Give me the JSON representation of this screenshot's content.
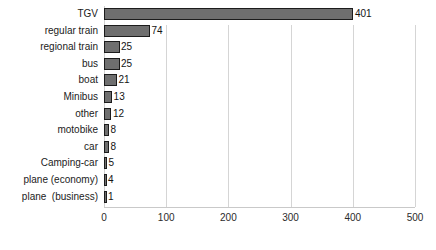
{
  "chart_data": {
    "type": "bar",
    "orientation": "horizontal",
    "title": "",
    "xlabel": "",
    "ylabel": "",
    "categories": [
      "TGV",
      "regular train",
      "regional train",
      "bus",
      "boat",
      "Minibus",
      "other",
      "motobike",
      "car",
      "Camping-car",
      "plane (economy)",
      "plane  (business)"
    ],
    "values": [
      401,
      74,
      25,
      25,
      21,
      13,
      12,
      8,
      8,
      5,
      4,
      1
    ],
    "value_labels": [
      "401",
      "74",
      "25",
      "25",
      "21",
      "13",
      "12",
      "8",
      "8",
      "5",
      "4",
      "1"
    ],
    "xlim": [
      0,
      500
    ],
    "xticks": [
      0,
      100,
      200,
      300,
      400,
      500
    ],
    "xtick_labels": [
      "0",
      "100",
      "200",
      "300",
      "400",
      "500"
    ],
    "grid": true,
    "grid_axis": "x",
    "legend": null,
    "colors": {
      "bar_fill": "#6f6f6f",
      "bar_edge": "#1c1c1c",
      "gridline": "#d5d5d5",
      "axis_line": "#c9c9c9",
      "text": "#1b1b1b",
      "background": "#ffffff"
    }
  }
}
